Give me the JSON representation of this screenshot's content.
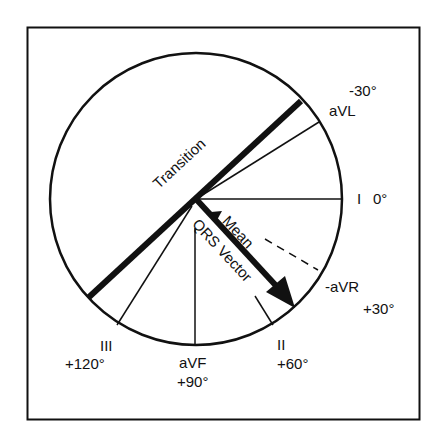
{
  "diagram": {
    "labels": {
      "avl_deg": "-30°",
      "avl": "aVL",
      "lead_i": "I",
      "lead_i_deg": "0°",
      "neg_avr": "-aVR",
      "neg_avr_deg": "+30°",
      "lead_ii": "II",
      "lead_ii_deg": "+60°",
      "avf": "aVF",
      "avf_deg": "+90°",
      "lead_iii": "III",
      "lead_iii_deg": "+120°",
      "transition": "Transition",
      "mean": "Mean",
      "qrs_vector": "QRS Vector"
    },
    "colors": {
      "ink": "#111111",
      "background": "#ffffff"
    }
  }
}
